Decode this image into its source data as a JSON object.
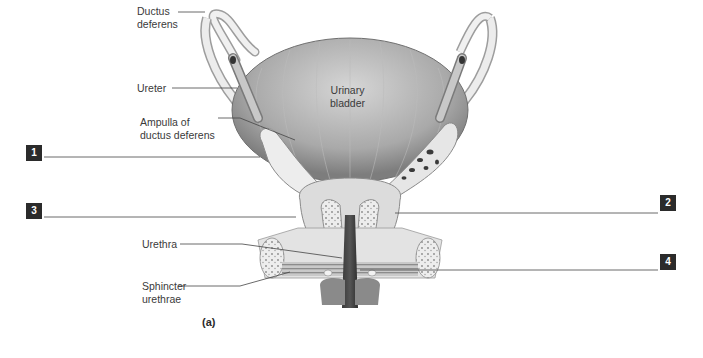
{
  "figure": {
    "caption": "(a)",
    "colors": {
      "background": "#ffffff",
      "ink": "#3a3a3a",
      "numbox": "#2b2b2b",
      "numbox_text": "#ffffff",
      "leader": "#444444"
    }
  },
  "labels": {
    "ductus_deferens": "Ductus\ndeferens",
    "ureter": "Ureter",
    "ampulla": "Ampulla of\nductus deferens",
    "urinary_bladder": "Urinary\nbladder",
    "urethra": "Urethra",
    "sphincter": "Sphincter\nurethrae"
  },
  "numbered_boxes": [
    {
      "num": "1",
      "side": "left"
    },
    {
      "num": "2",
      "side": "right"
    },
    {
      "num": "3",
      "side": "left"
    },
    {
      "num": "4",
      "side": "right"
    }
  ]
}
